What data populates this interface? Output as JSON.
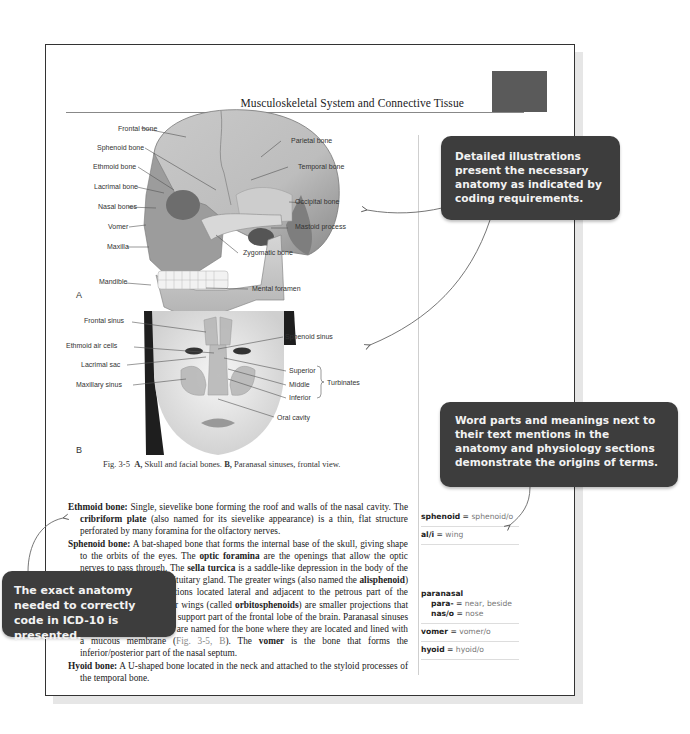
{
  "page": {
    "running_title": "Musculoskeletal System and Connective Tissue",
    "page_number": "67"
  },
  "figure_a": {
    "panel_letter": "A",
    "labels": {
      "frontal_bone": "Frontal bone",
      "sphenoid_bone": "Sphenoid bone",
      "ethmoid_bone": "Ethmoid bone",
      "lacrimal_bone": "Lacrimal bone",
      "nasal_bones": "Nasal bones",
      "vomer": "Vomer",
      "maxilla": "Maxilla",
      "mandible": "Mandible",
      "parietal_bone": "Parietal bone",
      "temporal_bone": "Temporal bone",
      "occipital_bone": "Occipital bone",
      "mastoid_process": "Mastoid process",
      "zygomatic_bone": "Zygomatic bone",
      "mental_foramen": "Mental foramen"
    }
  },
  "figure_b": {
    "panel_letter": "B",
    "labels": {
      "frontal_sinus": "Frontal sinus",
      "ethmoid_air_cells": "Ethmoid air cells",
      "lacrimal_sac": "Lacrimal sac",
      "maxillary_sinus": "Maxillary sinus",
      "sphenoid_sinus": "Sphenoid sinus",
      "superior": "Superior",
      "middle": "Middle",
      "inferior": "Inferior",
      "turbinates": "Turbinates",
      "oral_cavity": "Oral cavity"
    }
  },
  "caption": {
    "fig_num": "Fig. 3-5",
    "a": "A,",
    "a_text": "Skull and facial bones.",
    "b": "B,",
    "b_text": "Paranasal sinuses, frontal view."
  },
  "body": {
    "ethmoid": {
      "term": "Ethmoid bone:",
      "t1": " Single, sievelike bone forming the roof and walls of the nasal cavity. The ",
      "k1": "cribriform plate",
      "t2": " (also named for its sievelike appearance) is a thin, flat structure perforated by many foramina for the olfactory nerves."
    },
    "sphenoid": {
      "term": "Sphenoid bone:",
      "t1": " A bat-shaped bone that forms the internal base of the skull, giving shape to the orbits of the eyes. The ",
      "k1": "optic foramina",
      "t2": " are the openings that allow the optic nerves to pass through. The ",
      "k2": "sella turcica",
      "t3": " is a saddle-like depression in the body of the sphenoid that holds the pituitary gland. The greater wings (also named the ",
      "k3": "alisphenoid",
      "t4": ") are the triangular projections located lateral and adjacent to the petrous part of the temporal bone. The lesser wings (called ",
      "k4": "orbitosphenoids",
      "t5": ") are smaller projections that form part of the orbit and support part of the frontal lobe of the brain. Paranasal sinuses are air-filled cavities that are named for the bone where they are located and lined with a mucous membrane (",
      "ref": "Fig. 3-5, B",
      "t6": "). The ",
      "k5": "vomer",
      "t7": " is the bone that forms the inferior/posterior part of the nasal septum."
    },
    "hyoid": {
      "term": "Hyoid bone:",
      "t1": " A U-shaped bone located in the neck and attached to the styloid processes of the temporal bone."
    }
  },
  "glossary": {
    "sphenoid": {
      "term": "sphenoid",
      "eq": " = ",
      "def": "sphenoid/o"
    },
    "ali": {
      "term": "al/i",
      "eq": " = ",
      "def": "wing"
    },
    "paranasal": {
      "term": "paranasal"
    },
    "para": {
      "term": "para-",
      "eq": " = ",
      "def": "near, beside"
    },
    "nas": {
      "term": "nas/o",
      "eq": " = ",
      "def": "nose"
    },
    "vomer": {
      "term": "vomer",
      "eq": " = ",
      "def": "vomer/o"
    },
    "hyoid": {
      "term": "hyoid",
      "eq": " = ",
      "def": "hyoid/o"
    }
  },
  "callouts": {
    "illustrations": "Detailed illustrations present the necessary anatomy as indicated by coding requirements.",
    "word_parts": "Word parts and meanings next to their text mentions in the anatomy and physiology sections demonstrate the origins of terms.",
    "exact_anatomy": "The exact anatomy needed to correctly code in ICD-10 is presented."
  },
  "colors": {
    "callout_bg": "#3d3d3d",
    "tab_block": "#5a5a5a",
    "page_border": "#333333"
  }
}
